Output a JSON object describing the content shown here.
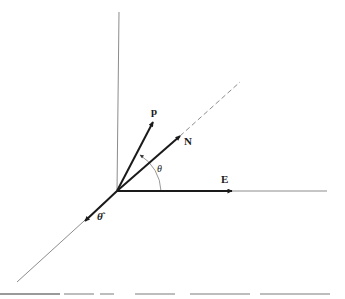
{
  "diagram": {
    "type": "vector-diagram",
    "colors": {
      "line": "#1a1a1a",
      "axis": "#8c8c8c",
      "background": "#ffffff"
    },
    "origin": {
      "x": 117,
      "y": 191
    },
    "labels": {
      "p": "p",
      "N": "N",
      "E": "E",
      "theta": "θ",
      "theta_hat": "θ̂"
    },
    "axes": [
      {
        "name": "vertical-axis",
        "from": [
          119,
          12
        ],
        "to": [
          117,
          191
        ]
      },
      {
        "name": "horizontal-axis",
        "from": [
          117,
          191
        ],
        "to": [
          327,
          191
        ]
      },
      {
        "name": "oblique-axis",
        "from": [
          117,
          191
        ],
        "to": [
          17,
          282
        ]
      }
    ],
    "vectors": [
      {
        "name": "p-vector",
        "label": "p",
        "tip": [
          153,
          122
        ]
      },
      {
        "name": "N-vector",
        "label": "N",
        "tip": [
          180,
          136
        ]
      },
      {
        "name": "E-vector",
        "label": "E",
        "tip": [
          232,
          191
        ]
      },
      {
        "name": "theta-hat-vector",
        "label": "θ̂",
        "tip": [
          85,
          221
        ]
      }
    ],
    "dashed_extension": {
      "from": [
        180,
        136
      ],
      "to": [
        240,
        82
      ]
    },
    "angle_arc": {
      "label": "θ",
      "from_axis": "E",
      "to_vector": "p",
      "radius": 44
    }
  }
}
